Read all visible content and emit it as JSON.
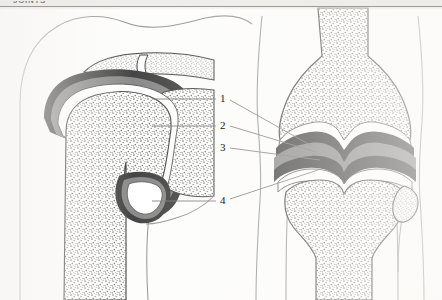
{
  "page": {
    "header_title": "JOINTS",
    "background_color": "#fdfdfc",
    "ink_color": "#1a1a1a",
    "width": 442,
    "height": 300
  },
  "figure": {
    "caption": "",
    "panels": [
      {
        "id": "shoulder",
        "name": "shoulder-joint-coronal-section",
        "description": "Coronal section through the glenohumeral (shoulder) joint showing humeral head, glenoid, acromion and joint capsule"
      },
      {
        "id": "knee",
        "name": "knee-joint-coronal-section",
        "description": "Coronal section through the knee joint showing femoral condyles, tibial plateau, fibula and joint capsule"
      }
    ],
    "labels": [
      {
        "number": "1",
        "x": 222,
        "y": 99,
        "name": "label-1"
      },
      {
        "number": "2",
        "x": 222,
        "y": 126,
        "name": "label-2"
      },
      {
        "number": "3",
        "x": 222,
        "y": 148,
        "name": "label-3"
      },
      {
        "number": "4",
        "x": 222,
        "y": 201,
        "name": "label-4"
      }
    ],
    "colors": {
      "outline": "#1b1b1b",
      "capsule_dark": "#171717",
      "synovium_gray": "#6e6e6e",
      "cartilage_white": "#ffffff",
      "trabecular_bone": "#cfcdc8",
      "soft_tissue": "#8a8a8a",
      "leader_line": "#5a5a5a"
    }
  }
}
